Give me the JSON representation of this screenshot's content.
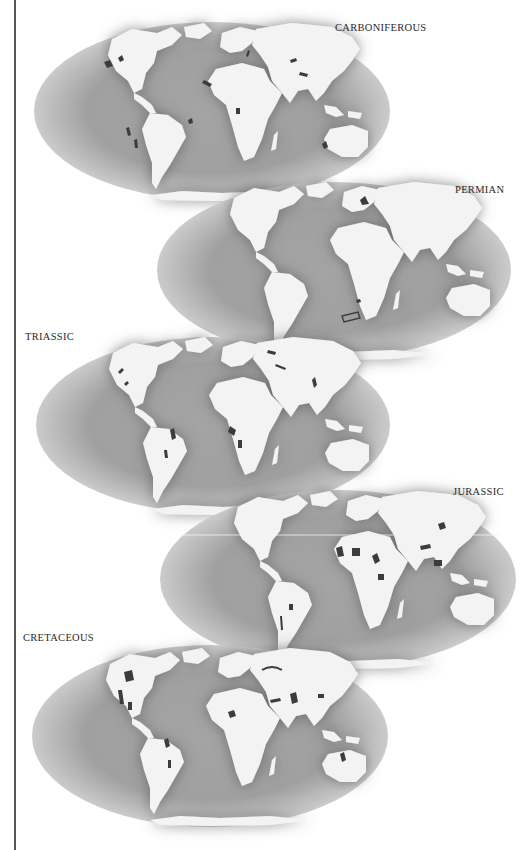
{
  "figure": {
    "colors": {
      "ocean_edge": "#c9c9c9",
      "ocean_mid": "#a8a8a8",
      "ocean_near_land": "#7d7d7d",
      "land": "#f3f3f3",
      "deposits": "#3c3c3c",
      "label": "#2a2a2a",
      "rule": "#555555"
    },
    "maps": [
      {
        "label": "CARBONIFEROUS",
        "cx": 212,
        "cy": 111,
        "rx": 178,
        "ry": 89,
        "label_x": 335,
        "label_y": 22
      },
      {
        "label": "PERMIAN",
        "cx": 334,
        "cy": 270,
        "rx": 177,
        "ry": 88,
        "label_x": 455,
        "label_y": 184
      },
      {
        "label": "TRIASSIC",
        "cx": 213,
        "cy": 425,
        "rx": 177,
        "ry": 88,
        "label_x": 25,
        "label_y": 331
      },
      {
        "label": "JURASSIC",
        "cx": 338,
        "cy": 579,
        "rx": 178,
        "ry": 89,
        "label_x": 453,
        "label_y": 486
      },
      {
        "label": "CRETACEOUS",
        "cx": 210,
        "cy": 736,
        "rx": 178,
        "ry": 91,
        "label_x": 23,
        "label_y": 632
      }
    ]
  }
}
